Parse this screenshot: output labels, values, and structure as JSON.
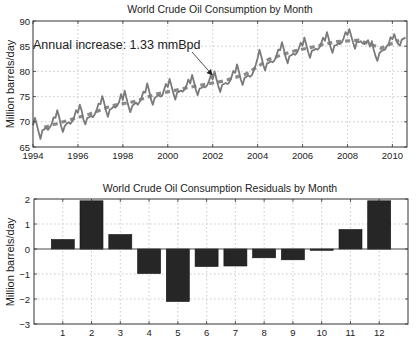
{
  "chart_data": [
    {
      "type": "line",
      "title": "World Crude Oil Consumption by Month",
      "xlabel": "",
      "ylabel": "Million barrels/day",
      "xlim": [
        1994,
        2010.65
      ],
      "ylim": [
        65,
        90
      ],
      "xticks": [
        1994,
        1996,
        1998,
        2000,
        2002,
        2004,
        2006,
        2008,
        2010
      ],
      "yticks": [
        65,
        70,
        75,
        80,
        85,
        90
      ],
      "grid": true,
      "annotation": {
        "text": "Annual increase: 1.33 mmBpd",
        "arrow_to": {
          "x": 2002.0,
          "y": 79.2
        }
      },
      "series": [
        {
          "name": "Monthly consumption",
          "style": "solid",
          "color": "#7a7a7a",
          "x_start": 1994.0,
          "x_step": 0.0833333,
          "values": [
            69.3,
            70.8,
            69.5,
            68.0,
            66.6,
            68.3,
            68.5,
            68.8,
            68.4,
            68.9,
            69.5,
            70.9,
            70.8,
            72.3,
            70.9,
            69.1,
            68.0,
            69.2,
            69.6,
            69.9,
            69.6,
            70.1,
            71.0,
            72.3,
            71.8,
            73.4,
            72.2,
            70.4,
            69.5,
            70.8,
            70.9,
            71.2,
            70.9,
            71.5,
            72.3,
            73.6,
            73.5,
            75.1,
            73.8,
            72.2,
            71.0,
            72.4,
            72.6,
            73.0,
            72.8,
            73.2,
            73.9,
            75.5,
            74.3,
            76.2,
            74.6,
            73.1,
            71.9,
            73.1,
            73.5,
            73.8,
            73.4,
            74.0,
            74.8,
            76.0,
            75.8,
            77.6,
            76.2,
            74.5,
            73.4,
            74.7,
            75.0,
            75.3,
            75.0,
            75.2,
            76.3,
            77.5,
            76.9,
            78.5,
            77.1,
            75.6,
            74.4,
            75.8,
            76.0,
            76.2,
            76.0,
            76.4,
            77.2,
            78.4,
            77.6,
            79.3,
            77.9,
            76.3,
            75.3,
            76.6,
            76.7,
            77.0,
            76.8,
            77.2,
            78.1,
            79.2,
            78.4,
            80.0,
            78.5,
            77.1,
            75.9,
            77.3,
            77.5,
            77.7,
            77.5,
            77.9,
            78.8,
            80.1,
            79.7,
            81.4,
            80.0,
            78.4,
            77.3,
            78.7,
            78.9,
            79.2,
            78.9,
            79.3,
            80.2,
            81.3,
            82.6,
            84.3,
            82.9,
            81.3,
            80.2,
            81.6,
            81.7,
            82.0,
            81.8,
            82.2,
            83.0,
            84.3,
            84.2,
            85.8,
            84.4,
            82.8,
            81.6,
            83.0,
            83.2,
            83.5,
            83.3,
            83.7,
            84.5,
            85.7,
            85.1,
            86.7,
            85.3,
            83.8,
            82.7,
            84.1,
            84.2,
            84.5,
            84.3,
            84.7,
            85.6,
            86.7,
            86.1,
            87.8,
            86.4,
            84.8,
            83.7,
            85.1,
            85.2,
            85.5,
            85.4,
            85.8,
            86.6,
            87.8,
            87.2,
            88.4,
            87.0,
            85.7,
            84.5,
            85.9,
            85.8,
            86.0,
            85.6,
            85.4,
            85.8,
            86.2,
            84.9,
            86.0,
            84.3,
            83.0,
            82.1,
            83.6,
            84.0,
            84.2,
            84.3,
            85.0,
            85.4,
            86.8,
            86.4,
            87.4,
            86.2,
            85.5,
            85.1,
            86.3,
            86.5,
            86.7
          ]
        },
        {
          "name": "Linear trend (annual means)",
          "style": "dashed",
          "color": "#8a8a8a",
          "x": [
            1994.5,
            1995.5,
            1996.5,
            1997.5,
            1998.5,
            1999.5,
            2000.5,
            2001.5,
            2002.5,
            2003.5,
            2004.5,
            2005.5,
            2006.5,
            2007.5,
            2008.5,
            2009.5,
            2010.3
          ],
          "values": [
            68.9,
            70.2,
            71.5,
            73.2,
            74.0,
            75.5,
            76.4,
            77.3,
            78.1,
            79.5,
            82.4,
            83.9,
            84.9,
            85.9,
            86.2,
            84.6,
            86.2
          ]
        }
      ]
    },
    {
      "type": "bar",
      "title": "World Crude Oil Consumption Residuals by Month",
      "xlabel": "",
      "ylabel": "Million barrels/day",
      "categories": [
        "1",
        "2",
        "3",
        "4",
        "5",
        "6",
        "7",
        "8",
        "9",
        "10",
        "11",
        "12"
      ],
      "values": [
        0.38,
        1.93,
        0.58,
        -0.98,
        -2.1,
        -0.7,
        -0.68,
        -0.35,
        -0.43,
        -0.05,
        0.78,
        1.93
      ],
      "xlim": [
        0,
        13
      ],
      "ylim": [
        -3,
        2
      ],
      "yticks": [
        -3,
        -2,
        -1,
        0,
        1,
        2
      ],
      "grid": true,
      "bar_color": "#262626"
    }
  ]
}
